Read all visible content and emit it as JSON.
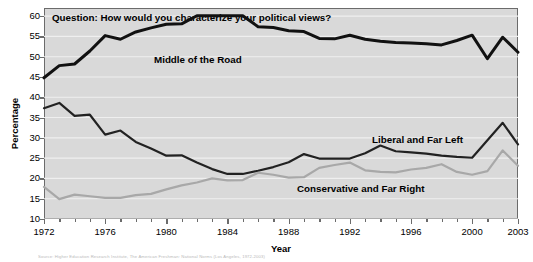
{
  "chart_data": {
    "type": "line",
    "title": "Question: How would you characterize your political views?",
    "xlabel": "Year",
    "ylabel": "Percentage",
    "ylim": [
      10,
      62
    ],
    "xlim": [
      1972,
      2003
    ],
    "yticks": [
      10,
      15,
      20,
      25,
      30,
      35,
      40,
      45,
      50,
      55,
      60
    ],
    "xticks": [
      1972,
      1976,
      1980,
      1984,
      1988,
      1992,
      1996,
      2000,
      2003
    ],
    "grid": true,
    "legend_position": "inline-annotations",
    "x": [
      1972,
      1973,
      1974,
      1975,
      1976,
      1977,
      1978,
      1979,
      1980,
      1981,
      1982,
      1983,
      1984,
      1985,
      1986,
      1987,
      1988,
      1989,
      1990,
      1991,
      1992,
      1993,
      1994,
      1995,
      1996,
      1997,
      1998,
      1999,
      2000,
      2001,
      2002,
      2003
    ],
    "series": [
      {
        "name": "Middle of the Road",
        "color": "#111111",
        "values": [
          44.8,
          47.8,
          48.2,
          51.4,
          55.2,
          54.3,
          56.1,
          57.1,
          58.0,
          58.1,
          60.1,
          60.1,
          60.1,
          60.1,
          57.4,
          57.2,
          56.4,
          56.2,
          54.5,
          54.4,
          55.3,
          54.3,
          53.8,
          53.5,
          53.4,
          53.2,
          52.9,
          54.0,
          55.3,
          49.5,
          54.8,
          51.1
        ]
      },
      {
        "name": "Liberal and Far Left",
        "color": "#222222",
        "values": [
          37.3,
          38.6,
          35.4,
          35.7,
          30.8,
          31.8,
          29.0,
          27.4,
          25.6,
          25.7,
          23.9,
          22.3,
          21.1,
          21.1,
          21.9,
          22.8,
          24.0,
          26.0,
          24.9,
          24.9,
          24.9,
          26.2,
          28.1,
          26.7,
          26.4,
          26.1,
          25.6,
          25.3,
          25.1,
          29.4,
          33.7,
          28.4
        ]
      },
      {
        "name": "Conservative and Far Right",
        "color": "#a8a8a8",
        "values": [
          17.9,
          14.9,
          16.0,
          15.6,
          15.2,
          15.2,
          15.9,
          16.2,
          17.3,
          18.3,
          19.0,
          20.0,
          19.5,
          19.6,
          21.4,
          20.9,
          20.2,
          20.3,
          22.6,
          23.3,
          23.9,
          22.0,
          21.6,
          21.5,
          22.2,
          22.6,
          23.5,
          21.6,
          20.9,
          21.8,
          26.9,
          23.1
        ]
      }
    ]
  },
  "title": {
    "text": "Question: How would you characterize your political views?"
  },
  "axes": {
    "ylabel": "Percentage",
    "xlabel": "Year",
    "yticks": [
      "60",
      "55",
      "50",
      "45",
      "40",
      "35",
      "30",
      "25",
      "20",
      "15",
      "10"
    ],
    "xticks": [
      "1972",
      "1976",
      "1980",
      "1984",
      "1988",
      "1992",
      "1996",
      "2000",
      "2003"
    ]
  },
  "annotations": {
    "middle": "Middle of the Road",
    "liberal": "Liberal and Far Left",
    "conservative": "Conservative and Far Right"
  },
  "source_note": "Source: Higher Education Research Institute, The American Freshman: National Norms (Los Angeles, 1972-2003)",
  "colors": {
    "plot_background": "#d9d9d9",
    "frame": "#6b6b6b",
    "gridline": "#efefef",
    "middle_line": "#111111",
    "liberal_line": "#222222",
    "conservative_line": "#a8a8a8"
  }
}
